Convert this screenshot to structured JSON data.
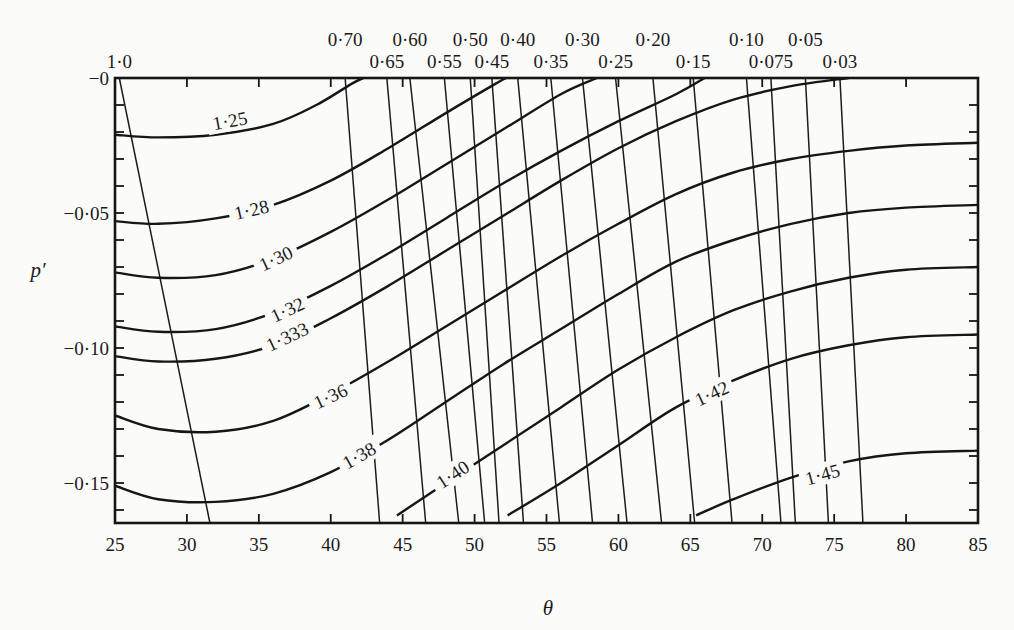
{
  "chart_data": {
    "type": "line",
    "title": "",
    "xlabel": "θ",
    "ylabel": "p′",
    "xlim": [
      25,
      85
    ],
    "ylim": [
      -0.162,
      0
    ],
    "x_ticks": [
      25,
      30,
      35,
      40,
      45,
      50,
      55,
      60,
      65,
      70,
      75,
      80,
      85
    ],
    "x_tick_labels": [
      "25",
      "30",
      "35",
      "40",
      "45",
      "50",
      "55",
      "60",
      "65",
      "70",
      "75",
      "80",
      "85"
    ],
    "y_ticks": [
      0,
      -0.05,
      -0.1,
      -0.15
    ],
    "y_tick_labels": [
      "−0",
      "−0·05",
      "−0·10",
      "−0·15"
    ],
    "y_minor_tick_step": 0.01,
    "grid": false,
    "legend": null,
    "vertical_family": {
      "description": "Near-vertical lines labelled along the top edge",
      "lines": [
        {
          "label": "1·0",
          "top_x": 25.3,
          "bottom_x": 31.6,
          "label_row": 2
        },
        {
          "label": "0·70",
          "top_x": 41.0,
          "bottom_x": 43.4,
          "label_row": 1
        },
        {
          "label": "0·65",
          "top_x": 43.9,
          "bottom_x": 46.6,
          "label_row": 2
        },
        {
          "label": "0·60",
          "top_x": 45.5,
          "bottom_x": 48.9,
          "label_row": 1
        },
        {
          "label": "0·55",
          "top_x": 47.9,
          "bottom_x": 50.7,
          "label_row": 2
        },
        {
          "label": "0·50",
          "top_x": 49.7,
          "bottom_x": 51.7,
          "label_row": 1
        },
        {
          "label": "0·45",
          "top_x": 51.2,
          "bottom_x": 53.4,
          "label_row": 2
        },
        {
          "label": "0·40",
          "top_x": 53.0,
          "bottom_x": 55.9,
          "label_row": 1
        },
        {
          "label": "0·35",
          "top_x": 55.3,
          "bottom_x": 58.2,
          "label_row": 2
        },
        {
          "label": "0·30",
          "top_x": 57.5,
          "bottom_x": 60.6,
          "label_row": 1
        },
        {
          "label": "0·25",
          "top_x": 59.8,
          "bottom_x": 63.0,
          "label_row": 2
        },
        {
          "label": "0·20",
          "top_x": 62.4,
          "bottom_x": 65.3,
          "label_row": 1
        },
        {
          "label": "0·15",
          "top_x": 65.2,
          "bottom_x": 67.9,
          "label_row": 2
        },
        {
          "label": "0·10",
          "top_x": 68.9,
          "bottom_x": 71.3,
          "label_row": 1
        },
        {
          "label": "0·075",
          "top_x": 70.6,
          "bottom_x": 72.3,
          "label_row": 2
        },
        {
          "label": "0·05",
          "top_x": 73.0,
          "bottom_x": 74.6,
          "label_row": 1
        },
        {
          "label": "0·03",
          "top_x": 75.4,
          "bottom_x": 77.0,
          "label_row": 2
        }
      ]
    },
    "series": [
      {
        "name": "1·25",
        "points": [
          [
            25,
            -0.021
          ],
          [
            28,
            -0.022
          ],
          [
            32,
            -0.021
          ],
          [
            36,
            -0.017
          ],
          [
            39,
            -0.01
          ],
          [
            41.5,
            -0.002
          ],
          [
            42.3,
            0
          ]
        ],
        "label_at": [
          33.0,
          -0.016
        ]
      },
      {
        "name": "1·28",
        "points": [
          [
            25,
            -0.053
          ],
          [
            28,
            -0.054
          ],
          [
            32,
            -0.052
          ],
          [
            36,
            -0.047
          ],
          [
            40,
            -0.038
          ],
          [
            44,
            -0.026
          ],
          [
            48,
            -0.013
          ],
          [
            51.5,
            -0.002
          ],
          [
            52.2,
            0
          ]
        ],
        "label_at": [
          34.5,
          -0.049
        ]
      },
      {
        "name": "1·30",
        "points": [
          [
            25,
            -0.072
          ],
          [
            28,
            -0.074
          ],
          [
            32,
            -0.073
          ],
          [
            36,
            -0.067
          ],
          [
            40,
            -0.057
          ],
          [
            44,
            -0.045
          ],
          [
            48,
            -0.032
          ],
          [
            52,
            -0.019
          ],
          [
            56,
            -0.006
          ],
          [
            58.5,
            0
          ]
        ],
        "label_at": [
          36.2,
          -0.067
        ]
      },
      {
        "name": "1·32",
        "points": [
          [
            25,
            -0.092
          ],
          [
            28,
            -0.094
          ],
          [
            32,
            -0.093
          ],
          [
            36,
            -0.087
          ],
          [
            40,
            -0.077
          ],
          [
            44,
            -0.065
          ],
          [
            48,
            -0.052
          ],
          [
            52,
            -0.039
          ],
          [
            56,
            -0.027
          ],
          [
            60,
            -0.016
          ],
          [
            64,
            -0.006
          ],
          [
            66,
            0
          ]
        ],
        "label_at": [
          37.0,
          -0.086
        ]
      },
      {
        "name": "1·333",
        "points": [
          [
            25,
            -0.103
          ],
          [
            28,
            -0.105
          ],
          [
            32,
            -0.104
          ],
          [
            36,
            -0.099
          ],
          [
            40,
            -0.089
          ],
          [
            44,
            -0.077
          ],
          [
            48,
            -0.064
          ],
          [
            52,
            -0.051
          ],
          [
            56,
            -0.038
          ],
          [
            60,
            -0.026
          ],
          [
            64,
            -0.016
          ],
          [
            68,
            -0.008
          ],
          [
            72,
            -0.003
          ],
          [
            76,
            0
          ]
        ],
        "label_at": [
          37.0,
          -0.096
        ]
      },
      {
        "name": "1·36",
        "points": [
          [
            25,
            -0.125
          ],
          [
            28,
            -0.13
          ],
          [
            32,
            -0.131
          ],
          [
            36,
            -0.127
          ],
          [
            40,
            -0.117
          ],
          [
            44,
            -0.105
          ],
          [
            48,
            -0.092
          ],
          [
            52,
            -0.079
          ],
          [
            56,
            -0.066
          ],
          [
            60,
            -0.054
          ],
          [
            64,
            -0.043
          ],
          [
            68,
            -0.035
          ],
          [
            72,
            -0.03
          ],
          [
            76,
            -0.027
          ],
          [
            80,
            -0.025
          ],
          [
            85,
            -0.024
          ]
        ],
        "label_at": [
          40.0,
          -0.118
        ]
      },
      {
        "name": "1·38",
        "points": [
          [
            25,
            -0.151
          ],
          [
            28,
            -0.156
          ],
          [
            32,
            -0.157
          ],
          [
            36,
            -0.154
          ],
          [
            40,
            -0.146
          ],
          [
            44,
            -0.134
          ],
          [
            48,
            -0.12
          ],
          [
            52,
            -0.106
          ],
          [
            56,
            -0.093
          ],
          [
            60,
            -0.08
          ],
          [
            64,
            -0.068
          ],
          [
            68,
            -0.06
          ],
          [
            72,
            -0.054
          ],
          [
            76,
            -0.05
          ],
          [
            80,
            -0.048
          ],
          [
            85,
            -0.047
          ]
        ],
        "label_at": [
          42.0,
          -0.14
        ]
      },
      {
        "name": "1·40",
        "points": [
          [
            44.6,
            -0.162
          ],
          [
            48,
            -0.15
          ],
          [
            52,
            -0.136
          ],
          [
            56,
            -0.122
          ],
          [
            60,
            -0.108
          ],
          [
            64,
            -0.096
          ],
          [
            68,
            -0.086
          ],
          [
            72,
            -0.079
          ],
          [
            76,
            -0.074
          ],
          [
            80,
            -0.071
          ],
          [
            85,
            -0.07
          ]
        ],
        "label_at": [
          48.5,
          -0.147
        ]
      },
      {
        "name": "1·42",
        "points": [
          [
            52.3,
            -0.162
          ],
          [
            56,
            -0.15
          ],
          [
            60,
            -0.136
          ],
          [
            64,
            -0.122
          ],
          [
            68,
            -0.112
          ],
          [
            72,
            -0.104
          ],
          [
            76,
            -0.099
          ],
          [
            80,
            -0.096
          ],
          [
            85,
            -0.095
          ]
        ],
        "label_at": [
          66.5,
          -0.117
        ]
      },
      {
        "name": "1·45",
        "points": [
          [
            65.4,
            -0.162
          ],
          [
            68,
            -0.156
          ],
          [
            72,
            -0.148
          ],
          [
            76,
            -0.142
          ],
          [
            80,
            -0.139
          ],
          [
            85,
            -0.138
          ]
        ],
        "label_at": [
          74.2,
          -0.147
        ]
      }
    ]
  }
}
